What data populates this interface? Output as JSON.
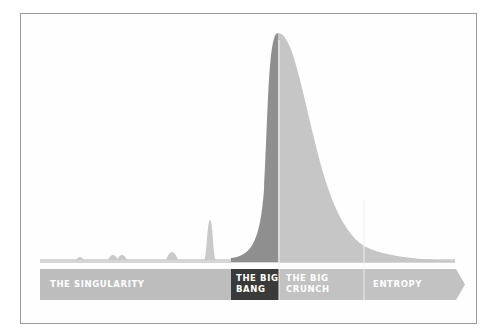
{
  "diagram": {
    "title": "",
    "type": "timeline-distribution",
    "timeline": {
      "segments": [
        {
          "id": "singularity",
          "label": "THE SINGULARITY",
          "color": "#bdbdbd",
          "x_start": 40,
          "x_end": 231
        },
        {
          "id": "big-bang",
          "label": "THE BIG\nBANG",
          "color": "#3a3a3a",
          "x_start": 231,
          "x_end": 279
        },
        {
          "id": "big-crunch",
          "label": "THE BIG\nCRUNCH",
          "color": "#c2c2c2",
          "x_start": 279,
          "x_end": 364
        },
        {
          "id": "entropy",
          "label": "ENTROPY",
          "color": "#c2c2c2",
          "x_start": 364,
          "x_end": 465
        }
      ]
    },
    "curve": {
      "peak_x": 278,
      "peak_y": 33,
      "baseline_y": 262,
      "rising_fill": "#8f8f8f",
      "falling_fill": "#c6c6c6",
      "small_spikes": [
        {
          "x": 80,
          "height": 3
        },
        {
          "x": 113,
          "height": 6
        },
        {
          "x": 122,
          "height": 6
        },
        {
          "x": 172,
          "height": 10
        },
        {
          "x": 210,
          "height": 40
        }
      ]
    },
    "colors": {
      "frame_border": "#9a9a9a",
      "background": "#ffffff",
      "baseline": "#d0d0d0",
      "label_text": "#ffffff"
    }
  }
}
